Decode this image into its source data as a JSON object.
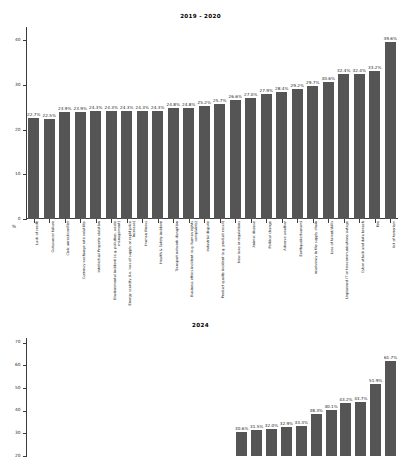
{
  "chart_data": [
    {
      "type": "bar",
      "title": "2019 - 2020",
      "xlabel": "",
      "ylabel": "%",
      "ylim": [
        0,
        43
      ],
      "yticks": [
        0,
        10,
        20,
        30,
        40
      ],
      "grid": false,
      "legend": "none",
      "categories": [
        "Lack of credit",
        "Outsourcer failure",
        "Civic unrest/conflict",
        "Currency exchange rate volatility",
        "Intellectual Property violation",
        "Environmental incident (e.g. pollution, waste management)",
        "Energy scarcity (i.e. loss of supply or rapid price increase)",
        "Human illness",
        "Health & Safety incident",
        "Transport network disruption",
        "Business ethics incident (e.g. human rights complaints)",
        "Industrial dispute",
        "Product quality incident (e.g. product recall)",
        "New laws or regulations",
        "Animal disease",
        "Political change",
        "Adverse weather",
        "Earthquake/tsunami",
        "Insolvency in the supply chain",
        "Loss of talent/skills",
        "Unplanned IT or telecommunications outage",
        "Cyber attack and data breach",
        "Fire",
        "Act of terrorism"
      ],
      "values": [
        22.7,
        22.5,
        23.9,
        23.9,
        24.3,
        24.3,
        24.3,
        24.3,
        24.3,
        24.8,
        24.8,
        25.2,
        25.7,
        26.6,
        27.0,
        27.9,
        28.4,
        29.2,
        29.7,
        30.6,
        32.4,
        32.4,
        33.2,
        39.6
      ],
      "labels": [
        "22.7%",
        "22.5%",
        "23.9%",
        "23.9%",
        "24.3%",
        "24.3%",
        "24.3%",
        "24.3%",
        "24.3%",
        "24.8%",
        "24.8%",
        "25.2%",
        "25.7%",
        "26.6%",
        "27.0%",
        "27.9%",
        "28.4%",
        "29.2%",
        "29.7%",
        "30.6%",
        "32.4%",
        "32.4%",
        "33.2%",
        "39.6%"
      ]
    },
    {
      "type": "bar",
      "title": "2024",
      "xlabel": "",
      "ylabel": "",
      "ylim": [
        20,
        72
      ],
      "yticks": [
        20,
        30,
        40,
        50,
        60,
        70
      ],
      "grid": false,
      "legend": "none",
      "categories": [
        "",
        "",
        "",
        "",
        "",
        "",
        "",
        "",
        "",
        "",
        "",
        "",
        "",
        "",
        "",
        "",
        "",
        "",
        "",
        "",
        "",
        "",
        "",
        ""
      ],
      "values": [
        null,
        null,
        null,
        null,
        null,
        null,
        null,
        null,
        null,
        null,
        null,
        null,
        null,
        null,
        30.6,
        31.5,
        32.0,
        32.9,
        33.3,
        38.3,
        40.1,
        43.2,
        43.7,
        51.9,
        61.7
      ],
      "labels": [
        "",
        "",
        "",
        "",
        "",
        "",
        "",
        "",
        "",
        "",
        "",
        "",
        "",
        "",
        "30.6%",
        "31.5%",
        "32.0%",
        "32.9%",
        "33.3%",
        "38.3%",
        "40.1%",
        "43.2%",
        "43.7%",
        "51.9%",
        "61.7%"
      ]
    }
  ],
  "style": {
    "bar_color": "#555555",
    "axis_color": "#3b3b3b",
    "text_color": "#1a1a1a",
    "background": "#ffffff"
  }
}
